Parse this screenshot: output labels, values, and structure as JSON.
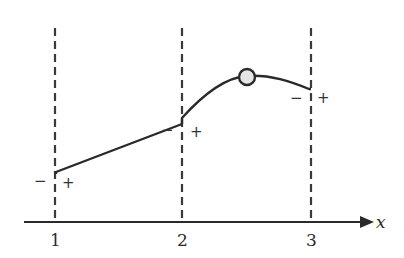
{
  "diagram": {
    "axis": {
      "label": "x",
      "ticks": [
        "1",
        "2",
        "3"
      ]
    },
    "vertical_lines": [
      {
        "x_value": "1",
        "left_sign": "−",
        "right_sign": "+"
      },
      {
        "x_value": "2",
        "left_sign": "−",
        "right_sign": "+"
      },
      {
        "x_value": "3",
        "left_sign": "−",
        "right_sign": "+"
      }
    ],
    "curve": {
      "segments": [
        "linear increasing from x=1 to x=2",
        "concave curve from x=2 to x=3 with a local maximum"
      ],
      "marker": "open circle at local maximum between x=2 and x=3"
    },
    "colors": {
      "stroke": "#2a2a2a",
      "marker_fill": "#e6e6e6"
    }
  }
}
